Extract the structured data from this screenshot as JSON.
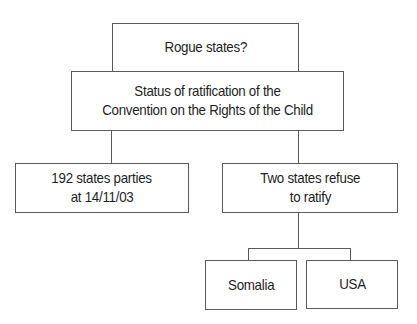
{
  "diagram": {
    "title_box": {
      "lines": [
        "Rogue states?"
      ]
    },
    "root": {
      "lines": [
        "Status of ratification of the",
        "Convention on the Rights of the Child"
      ]
    },
    "children": [
      {
        "lines": [
          "192 states parties",
          "at 14/11/03"
        ]
      },
      {
        "lines": [
          "Two states refuse",
          "to ratify"
        ],
        "children": [
          {
            "lines": [
              "Somalia"
            ]
          },
          {
            "lines": [
              "USA"
            ]
          }
        ]
      }
    ],
    "colors": {
      "stroke": "#5a5a5a",
      "text": "#1e1e1e",
      "background": "#ffffff"
    }
  }
}
